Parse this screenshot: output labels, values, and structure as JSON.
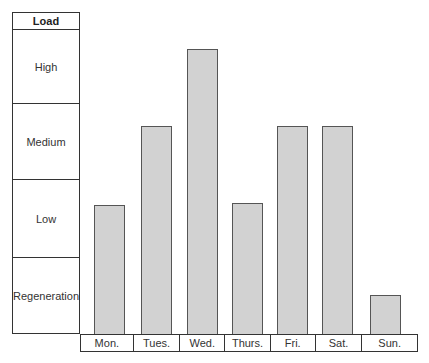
{
  "chart_data": {
    "type": "bar",
    "title": "",
    "xlabel": "",
    "ylabel": "Load",
    "y_categories": [
      "Regeneration",
      "Low",
      "Medium",
      "High"
    ],
    "categories": [
      "Mon.",
      "Tues.",
      "Wed.",
      "Thurs.",
      "Fri.",
      "Sat.",
      "Sun."
    ],
    "values": [
      1.67,
      2.7,
      3.7,
      1.7,
      2.7,
      2.7,
      0.5
    ],
    "value_levels": [
      "Low",
      "Medium",
      "High",
      "Low",
      "Medium",
      "Medium",
      "Regeneration"
    ],
    "ylim": [
      0,
      4
    ],
    "grid": false,
    "legend": false
  },
  "scale": {
    "header": "Load",
    "bands": [
      "High",
      "Medium",
      "Low",
      "Regeneration"
    ]
  },
  "colors": {
    "bar_fill": "#d2d2d2",
    "bar_border": "#555555",
    "line": "#333333"
  }
}
